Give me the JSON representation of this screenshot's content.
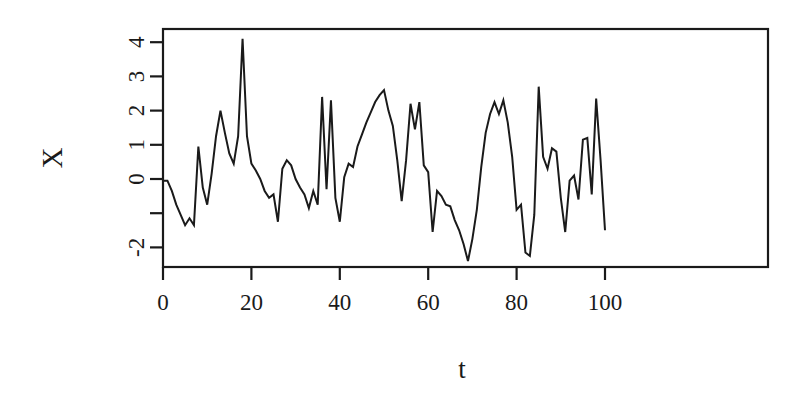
{
  "figure": {
    "background": "#ffffff",
    "line_color": "#1a1a1a",
    "axis_color": "#1a1a1a",
    "width": 810,
    "height": 397
  },
  "chart_data": {
    "type": "line",
    "title": "",
    "xlabel": "t",
    "ylabel": "X",
    "xlim": [
      0,
      100
    ],
    "ylim": [
      -2.6,
      4.3
    ],
    "grid": false,
    "legend": null,
    "x_ticks": [
      0,
      20,
      40,
      60,
      80,
      100
    ],
    "x_tick_labels": [
      "0",
      "20",
      "40",
      "60",
      "80",
      "100"
    ],
    "y_ticks": [
      -2,
      -1,
      0,
      1,
      2,
      3,
      4
    ],
    "y_tick_labels": [
      "-2",
      "",
      "0",
      "1",
      "2",
      "3",
      "4"
    ],
    "x": [
      0,
      1,
      2,
      3,
      4,
      5,
      6,
      7,
      8,
      9,
      10,
      11,
      12,
      13,
      14,
      15,
      16,
      17,
      18,
      19,
      20,
      21,
      22,
      23,
      24,
      25,
      26,
      27,
      28,
      29,
      30,
      31,
      32,
      33,
      34,
      35,
      36,
      37,
      38,
      39,
      40,
      41,
      42,
      43,
      44,
      45,
      46,
      47,
      48,
      49,
      50,
      51,
      52,
      53,
      54,
      55,
      56,
      57,
      58,
      59,
      60,
      61,
      62,
      63,
      64,
      65,
      66,
      67,
      68,
      69,
      70,
      71,
      72,
      73,
      74,
      75,
      76,
      77,
      78,
      79,
      80,
      81,
      82,
      83,
      84,
      85,
      86,
      87,
      88,
      89,
      90,
      91,
      92,
      93,
      94,
      95,
      96,
      97,
      98,
      99,
      100
    ],
    "values": [
      -0.05,
      -0.05,
      -0.35,
      -0.75,
      -1.05,
      -1.35,
      -1.15,
      -1.35,
      0.95,
      -0.25,
      -0.75,
      0.15,
      1.25,
      2.0,
      1.35,
      0.75,
      0.45,
      1.25,
      4.1,
      1.25,
      0.45,
      0.25,
      0.0,
      -0.35,
      -0.55,
      -0.45,
      -1.25,
      0.3,
      0.55,
      0.4,
      0.0,
      -0.25,
      -0.45,
      -0.85,
      -0.35,
      -0.75,
      2.4,
      -0.3,
      2.3,
      -0.55,
      -1.25,
      0.05,
      0.45,
      0.35,
      0.95,
      1.3,
      1.65,
      1.95,
      2.25,
      2.45,
      2.6,
      2.0,
      1.55,
      0.55,
      -0.65,
      0.55,
      2.2,
      1.45,
      2.25,
      0.4,
      0.2,
      -1.55,
      -0.35,
      -0.5,
      -0.75,
      -0.8,
      -1.2,
      -1.5,
      -1.9,
      -2.4,
      -1.75,
      -0.9,
      0.35,
      1.35,
      1.9,
      2.25,
      1.9,
      2.3,
      1.65,
      0.65,
      -0.9,
      -0.75,
      -2.15,
      -2.25,
      -1.05,
      2.7,
      0.65,
      0.3,
      0.9,
      0.8,
      -0.55,
      -1.55,
      -0.05,
      0.1,
      -0.6,
      1.15,
      1.2,
      -0.45,
      2.35,
      0.55,
      -1.5
    ],
    "series_note": "Simulated time series realization, 101 observations"
  },
  "labels": {
    "y_axis_title": "X",
    "x_axis_title": "t"
  }
}
